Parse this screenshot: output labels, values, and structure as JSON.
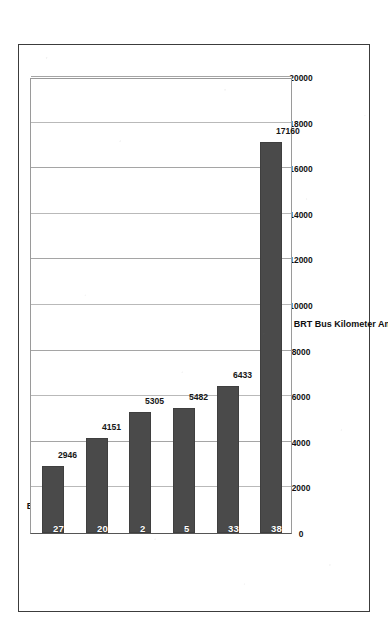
{
  "chart_data": {
    "type": "bar",
    "orientation": "rotated-90",
    "title": "",
    "xlabel": "",
    "ylabel": "Average Riders per BRT Bus Kilometer Among BRT Cities",
    "categories": [
      "Europe",
      "U.S./Canada",
      "Africa",
      "Australia/N.Z.",
      "Asia",
      "Latin America"
    ],
    "values": [
      2946,
      4151,
      5305,
      5482,
      6433,
      17160
    ],
    "city_counts": [
      27,
      20,
      2,
      5,
      33,
      38
    ],
    "value_labels": [
      "2946",
      "4151",
      "5305",
      "5482",
      "6433",
      "17160"
    ],
    "count_labels": [
      "27",
      "20",
      "2",
      "5",
      "33",
      "38"
    ],
    "ylim": [
      0,
      20000
    ],
    "tick_labels": [
      "0",
      "2000",
      "4000",
      "6000",
      "8000",
      "10000",
      "12000",
      "14000",
      "16000",
      "18000",
      "20000"
    ],
    "tick_values": [
      0,
      2000,
      4000,
      6000,
      8000,
      10000,
      12000,
      14000,
      16000,
      18000,
      20000
    ],
    "grid": true,
    "legend": "none",
    "bar_color": "#4a4a4a",
    "grid_color": "#b9b9b9",
    "axis_color": "#555555",
    "frame_color": "#3c3c3c",
    "count_label_color": "#ffffff",
    "value_label_color": "#171717"
  }
}
